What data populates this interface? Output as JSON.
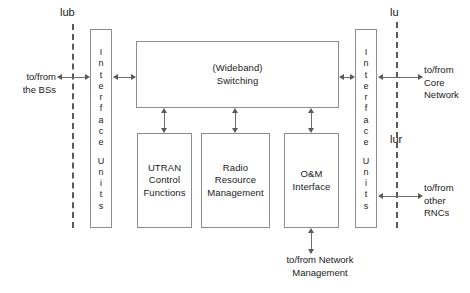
{
  "diagram": {
    "interface_labels": {
      "iub": "lub",
      "iu": "lu",
      "iur": "lur"
    },
    "external_endpoints": {
      "bs": "to/from\nthe BSs",
      "core_network": "to/from\nCore\nNetwork",
      "other_rncs": "to/from\nother\nRNCs",
      "network_management": "to/from Network\nManagement"
    },
    "interface_units": {
      "label": "Interface Units",
      "word1": "Interface",
      "word2": "Units",
      "left_name": "Interface Units",
      "right_name": "Interface Units"
    },
    "blocks": {
      "switching": "(Wideband)\nSwitching",
      "utran_control": "UTRAN\nControl\nFunctions",
      "radio_resource": "Radio\nResource\nManagement",
      "om_interface": "O&M\nInterface"
    },
    "colors": {
      "stroke": "#8d8d8d",
      "connector": "#6e6e6e",
      "dashed": "#5a5a5a",
      "text": "#1a1a1a",
      "background": "#ffffff"
    }
  }
}
